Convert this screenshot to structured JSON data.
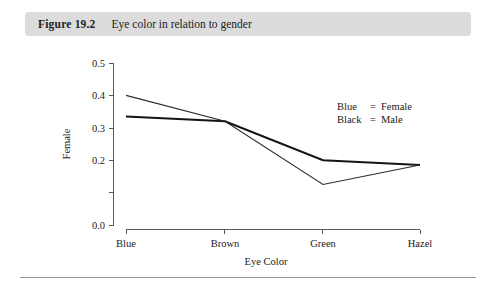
{
  "caption": {
    "figure_number": "Figure 19.2",
    "title": "Eye color in relation to gender"
  },
  "legend": {
    "rows": [
      {
        "key": "Blue",
        "eq": "=",
        "value": "Female"
      },
      {
        "key": "Black",
        "eq": "=",
        "value": "Male"
      }
    ]
  },
  "chart_data": {
    "type": "line",
    "title": "Eye color in relation to gender",
    "xlabel": "Eye Color",
    "ylabel": "Female",
    "categories": [
      "Blue",
      "Brown",
      "Green",
      "Hazel"
    ],
    "series": [
      {
        "name": "Female",
        "color_name": "Blue",
        "values": [
          0.4,
          0.32,
          0.125,
          0.185
        ]
      },
      {
        "name": "Male",
        "color_name": "Black",
        "values": [
          0.335,
          0.32,
          0.2,
          0.185
        ]
      }
    ],
    "ylim": [
      0.0,
      0.5
    ],
    "ytick_values": [
      0.0,
      0.1,
      0.2,
      0.3,
      0.4,
      0.5
    ],
    "ytick_labels": [
      "0.0",
      "",
      "0.2",
      "0.3",
      "0.4",
      "0.5"
    ],
    "xtick_labels": [
      "Blue",
      "Brown",
      "Green",
      "Hazel"
    ],
    "grid": false,
    "legend_position": "upper right inside"
  }
}
